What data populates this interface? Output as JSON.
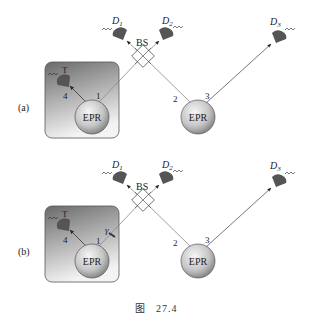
{
  "figure": {
    "caption_prefix": "图",
    "caption_number": "27.4",
    "panels": [
      {
        "id": "a",
        "label": "(a)",
        "source_local": "EPR",
        "source_remote": "EPR",
        "beam_splitter": "BS",
        "detectors": {
          "d1": "D",
          "d1_sub": "1",
          "d2": "D",
          "d2_sub": "2",
          "d3": "D",
          "d3_sub": "3",
          "t": "T"
        },
        "beam_labels": {
          "b1": "1",
          "b2": "2",
          "b3": "3",
          "b4": "4"
        }
      },
      {
        "id": "b",
        "label": "(b)",
        "source_local": "EPR",
        "source_remote": "EPR",
        "beam_splitter": "BS",
        "gate": "γ",
        "detectors": {
          "d1": "D",
          "d1_sub": "1",
          "d2": "D",
          "d2_sub": "2",
          "d3": "D",
          "d3_sub": "3",
          "t": "T"
        },
        "beam_labels": {
          "b1": "1",
          "b2": "2",
          "b3": "3",
          "b4": "4"
        }
      }
    ]
  },
  "colors": {
    "box_top": "#6e6e6e",
    "box_bottom": "#f2f2f2",
    "detector": "#555555",
    "beam": "#777777",
    "epr_light": "#f4f4f4",
    "epr_dark": "#8a8a8a"
  }
}
